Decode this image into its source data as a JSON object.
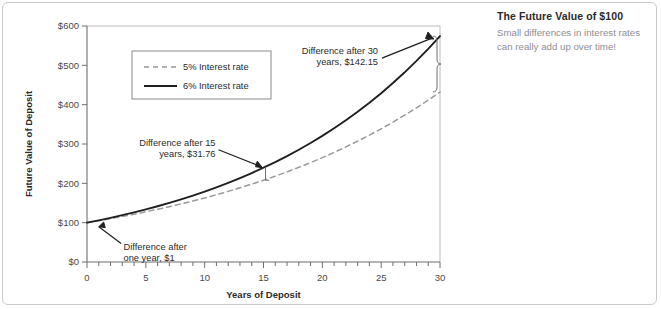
{
  "sidebar": {
    "title": "The Future Value of $100",
    "body": "Small differences in interest rates can really add up over time!",
    "title_color": "#2b2b2b",
    "body_color": "#8e8e93"
  },
  "chart_data": {
    "type": "line",
    "title": "",
    "xlabel": "Years of Deposit",
    "ylabel": "Future Value of Deposit",
    "xlim": [
      0,
      30
    ],
    "ylim": [
      0,
      600
    ],
    "xticks": [
      0,
      5,
      10,
      15,
      20,
      25,
      30
    ],
    "xticklabels": [
      "0",
      "5",
      "10",
      "15",
      "20",
      "25",
      "30"
    ],
    "xminor_step": 1,
    "yticks": [
      0,
      100,
      200,
      300,
      400,
      500,
      600
    ],
    "yticklabels": [
      "$0",
      "$100",
      "$200",
      "$300",
      "$400",
      "$500",
      "$600"
    ],
    "grid": false,
    "legend_position": "upper-left-inside",
    "x": [
      0,
      1,
      2,
      3,
      4,
      5,
      6,
      7,
      8,
      9,
      10,
      11,
      12,
      13,
      14,
      15,
      16,
      17,
      18,
      19,
      20,
      21,
      22,
      23,
      24,
      25,
      26,
      27,
      28,
      29,
      30
    ],
    "series": [
      {
        "name": "5% Interest rate",
        "style": "dashed",
        "color": "#9a9a9a",
        "values": [
          100.0,
          105.0,
          110.25,
          115.76,
          121.55,
          127.63,
          134.01,
          140.71,
          147.75,
          155.13,
          162.89,
          171.03,
          179.59,
          188.56,
          197.99,
          207.89,
          218.29,
          229.2,
          240.66,
          252.7,
          265.33,
          278.6,
          292.53,
          307.15,
          322.51,
          338.64,
          355.57,
          373.35,
          392.01,
          411.61,
          432.19
        ]
      },
      {
        "name": "6% Interest rate",
        "style": "solid",
        "color": "#1f1f1f",
        "values": [
          100.0,
          106.0,
          112.36,
          119.1,
          126.25,
          133.82,
          141.85,
          150.36,
          159.38,
          168.95,
          179.08,
          189.83,
          201.22,
          213.29,
          226.09,
          239.66,
          254.04,
          269.28,
          285.43,
          302.56,
          320.71,
          339.96,
          360.35,
          381.97,
          404.89,
          429.19,
          454.94,
          482.23,
          511.17,
          541.84,
          574.35
        ]
      }
    ],
    "annotations": [
      {
        "id": "after-one-year",
        "text": "Difference after\none year, $1",
        "lines": [
          "Difference after",
          "one year, $1"
        ],
        "target_year": 1,
        "value": "$1"
      },
      {
        "id": "after-15-years",
        "text": "Difference after 15\nyears, $31.76",
        "lines": [
          "Difference after 15",
          "years, $31.76"
        ],
        "target_year": 15,
        "value": "$31.76"
      },
      {
        "id": "after-30-years",
        "text": "Difference after 30\nyears, $142.15",
        "lines": [
          "Difference after 30",
          "years, $142.15"
        ],
        "target_year": 30,
        "value": "$142.15"
      }
    ],
    "legend": [
      {
        "label": "5% Interest rate",
        "style": "dashed",
        "color": "#9a9a9a"
      },
      {
        "label": "6% Interest rate",
        "style": "solid",
        "color": "#1f1f1f"
      }
    ]
  }
}
